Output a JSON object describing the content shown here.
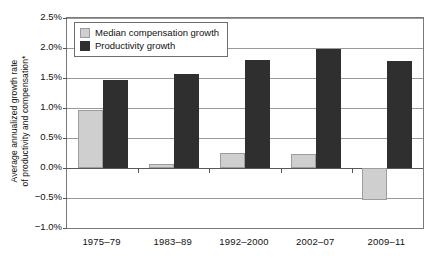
{
  "chart_data": {
    "type": "bar",
    "title": "",
    "xlabel": "",
    "ylabel": "Average annualized growth rate of productivity and compensation*",
    "ylabel_line1": "Average annualized growth rate",
    "ylabel_line2": "of productivity and compensation*",
    "categories": [
      "1975–79",
      "1983–89",
      "1992–2000",
      "2002–07",
      "2009–11"
    ],
    "series": [
      {
        "name": "Median compensation growth",
        "color": "#cfcfcf",
        "values": [
          0.97,
          0.06,
          0.25,
          0.24,
          -0.54
        ]
      },
      {
        "name": "Productivity growth",
        "color": "#2f2f2f",
        "values": [
          1.46,
          1.56,
          1.8,
          1.98,
          1.79
        ]
      }
    ],
    "ylim": [
      -1.0,
      2.5
    ],
    "ytick_values": [
      2.5,
      2.0,
      1.5,
      1.0,
      0.5,
      0.0,
      -0.5,
      -1.0
    ],
    "ytick_labels": [
      "2.5%",
      "2.0%",
      "1.5%",
      "1.0%",
      "0.5%",
      "0.0%",
      "−0.5%",
      "−1.0%"
    ],
    "grid": true,
    "legend_position": "top-left",
    "value_suffix": "%"
  }
}
